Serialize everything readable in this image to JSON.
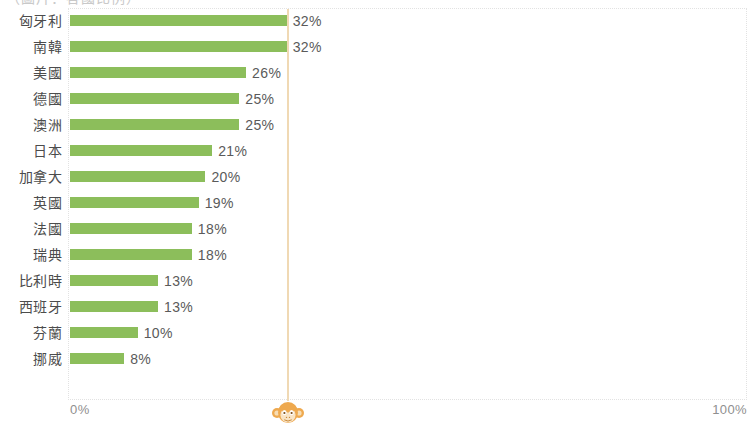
{
  "chart_data": {
    "type": "bar",
    "orientation": "horizontal",
    "title": "（圖片：各國比例）",
    "xlabel": "",
    "ylabel": "",
    "xlim": [
      0,
      100
    ],
    "grid": false,
    "legend": null,
    "bar_color": "#8cbe5b",
    "reference_line": {
      "value": 32,
      "color": "#f0d9b4",
      "marker_icon": "monkey-face-icon"
    },
    "axis_ticks": [
      "0%",
      "100%"
    ],
    "categories": [
      "匈牙利",
      "南韓",
      "美國",
      "德國",
      "澳洲",
      "日本",
      "加拿大",
      "英國",
      "法國",
      "瑞典",
      "比利時",
      "西班牙",
      "芬蘭",
      "挪威"
    ],
    "values": [
      32,
      32,
      26,
      25,
      25,
      21,
      20,
      19,
      18,
      18,
      13,
      13,
      10,
      8
    ],
    "value_labels": [
      "32%",
      "32%",
      "26%",
      "25%",
      "25%",
      "21%",
      "20%",
      "19%",
      "18%",
      "18%",
      "13%",
      "13%",
      "10%",
      "8%"
    ]
  },
  "axis": {
    "min_label": "0%",
    "max_label": "100%"
  }
}
